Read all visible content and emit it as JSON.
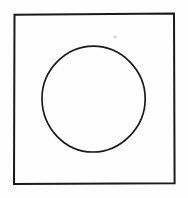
{
  "figure": {
    "title": "Square with inscribed circle",
    "canvas": {
      "width": 188,
      "height": 198,
      "background_color": "#fefefe"
    },
    "ink_color": "#1a1a1a",
    "shapes": [
      {
        "name": "square",
        "kind": "rectangle",
        "stroke_color": "#1a1a1a",
        "stroke_width": 2,
        "fill": "none",
        "x": 14,
        "y": 14,
        "width": 160,
        "height": 169
      },
      {
        "name": "circle",
        "kind": "ellipse",
        "stroke_color": "#1a1a1a",
        "stroke_width": 1.7,
        "fill": "none",
        "center_x": 93.5,
        "center_y": 99,
        "radius_x": 51.5,
        "radius_y": 53
      },
      {
        "name": "speck",
        "kind": "dot",
        "stroke_color": "#b9b9b9",
        "center_x": 115,
        "center_y": 37,
        "radius": 1.1
      }
    ]
  }
}
